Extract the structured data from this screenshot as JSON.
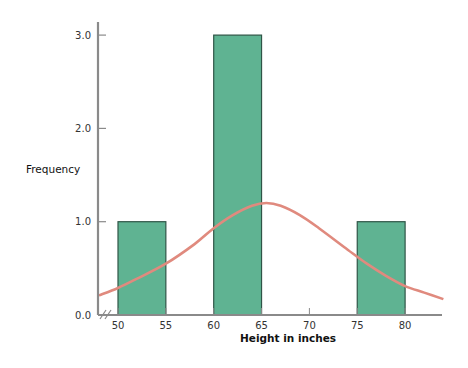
{
  "chart_data": {
    "type": "bar",
    "title": "",
    "xlabel": "Height in inches",
    "ylabel": "Frequency",
    "x_ticks": [
      50,
      55,
      60,
      65,
      70,
      75,
      80
    ],
    "y_ticks": [
      "0.0",
      "1.0",
      "2.0",
      "3.0"
    ],
    "ylim": [
      0,
      3.1
    ],
    "xlim": [
      48,
      84
    ],
    "axis_break": true,
    "grid": false,
    "bins": [
      {
        "range": [
          50,
          55
        ],
        "frequency": 1
      },
      {
        "range": [
          60,
          65
        ],
        "frequency": 3
      },
      {
        "range": [
          75,
          80
        ],
        "frequency": 1
      }
    ],
    "overlay_curve": {
      "type": "normal",
      "mean": 65.5,
      "peak": 1.2,
      "points": [
        [
          48,
          0.21
        ],
        [
          50,
          0.29
        ],
        [
          52,
          0.39
        ],
        [
          55,
          0.55
        ],
        [
          58,
          0.76
        ],
        [
          60,
          0.93
        ],
        [
          62,
          1.07
        ],
        [
          64,
          1.17
        ],
        [
          65.5,
          1.2
        ],
        [
          67,
          1.17
        ],
        [
          69,
          1.07
        ],
        [
          71,
          0.93
        ],
        [
          74,
          0.7
        ],
        [
          76,
          0.55
        ],
        [
          78,
          0.42
        ],
        [
          80,
          0.31
        ],
        [
          82,
          0.24
        ],
        [
          84,
          0.17
        ]
      ]
    },
    "colors": {
      "bar_fill": "#5fb392",
      "bar_stroke": "#2f5547",
      "curve": "#e08a7e",
      "axis": "#8a8a8a"
    }
  }
}
